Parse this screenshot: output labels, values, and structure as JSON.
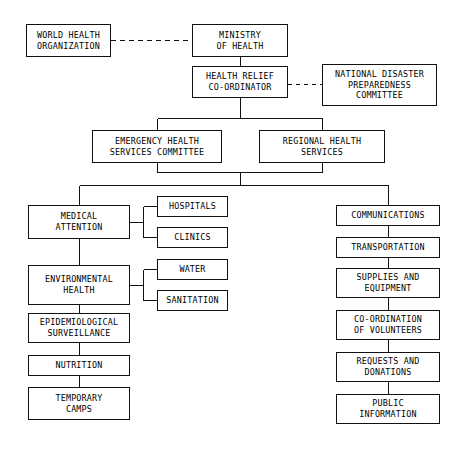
{
  "diagram": {
    "orientation": "top-down",
    "line_color": "#111111",
    "box_fill": "#ffffff",
    "text_color": "#000000",
    "nodes": [
      {
        "id": "who",
        "label": "WORLD HEALTH\nORGANIZATION",
        "x": 26,
        "y": 24,
        "w": 85,
        "h": 33
      },
      {
        "id": "ministry",
        "label": "MINISTRY\nOF HEALTH",
        "x": 192,
        "y": 24,
        "w": 96,
        "h": 33
      },
      {
        "id": "relief",
        "label": "HEALTH RELIEF\nCO-ORDINATOR",
        "x": 192,
        "y": 66,
        "w": 96,
        "h": 32
      },
      {
        "id": "ndpc",
        "label": "NATIONAL DISASTER\nPREPAREDNESS\nCOMMITTEE",
        "x": 322,
        "y": 64,
        "w": 115,
        "h": 42
      },
      {
        "id": "ehsc",
        "label": "EMERGENCY HEALTH\nSERVICES COMMITTEE",
        "x": 92,
        "y": 130,
        "w": 130,
        "h": 33
      },
      {
        "id": "rhs",
        "label": "REGIONAL HEALTH\nSERVICES",
        "x": 259,
        "y": 130,
        "w": 126,
        "h": 33
      },
      {
        "id": "medical",
        "label": "MEDICAL\nATTENTION",
        "x": 28,
        "y": 205,
        "w": 102,
        "h": 34
      },
      {
        "id": "hospitals",
        "label": "HOSPITALS",
        "x": 157,
        "y": 196,
        "w": 71,
        "h": 21
      },
      {
        "id": "clinics",
        "label": "CLINICS",
        "x": 157,
        "y": 227,
        "w": 71,
        "h": 21
      },
      {
        "id": "environmental",
        "label": "ENVIRONMENTAL\nHEALTH",
        "x": 28,
        "y": 265,
        "w": 102,
        "h": 40
      },
      {
        "id": "water",
        "label": "WATER",
        "x": 157,
        "y": 259,
        "w": 71,
        "h": 21
      },
      {
        "id": "sanitation",
        "label": "SANITATION",
        "x": 157,
        "y": 290,
        "w": 71,
        "h": 21
      },
      {
        "id": "epidemiological",
        "label": "EPIDEMIOLOGICAL\nSURVEILLANCE",
        "x": 28,
        "y": 313,
        "w": 102,
        "h": 30
      },
      {
        "id": "nutrition",
        "label": "NUTRITION",
        "x": 28,
        "y": 355,
        "w": 102,
        "h": 21
      },
      {
        "id": "temporary",
        "label": "TEMPORARY\nCAMPS",
        "x": 28,
        "y": 387,
        "w": 102,
        "h": 33
      },
      {
        "id": "communications",
        "label": "COMMUNICATIONS",
        "x": 336,
        "y": 205,
        "w": 104,
        "h": 21
      },
      {
        "id": "transportation",
        "label": "TRANSPORTATION",
        "x": 336,
        "y": 237,
        "w": 104,
        "h": 21
      },
      {
        "id": "supplies",
        "label": "SUPPLIES AND\nEQUIPMENT",
        "x": 336,
        "y": 268,
        "w": 104,
        "h": 30
      },
      {
        "id": "volunteers",
        "label": "CO-ORDINATION\nOF VOLUNTEERS",
        "x": 336,
        "y": 310,
        "w": 104,
        "h": 30
      },
      {
        "id": "requests",
        "label": "REQUESTS AND\nDONATIONS",
        "x": 336,
        "y": 352,
        "w": 104,
        "h": 30
      },
      {
        "id": "public",
        "label": "PUBLIC\nINFORMATION",
        "x": 336,
        "y": 394,
        "w": 104,
        "h": 30
      }
    ],
    "edges": [
      {
        "from": "who",
        "to": "ministry",
        "style": "dashed"
      },
      {
        "from": "relief",
        "to": "ndpc",
        "style": "dashed"
      },
      {
        "from": "ministry",
        "to": "relief",
        "style": "solid"
      },
      {
        "from": "relief",
        "to": "ehsc",
        "style": "solid"
      },
      {
        "from": "relief",
        "to": "rhs",
        "style": "solid"
      },
      {
        "from": "ehsc",
        "to": "services-bus",
        "style": "solid"
      },
      {
        "from": "rhs",
        "to": "services-bus",
        "style": "solid"
      },
      {
        "from": "services-bus",
        "to": "medical",
        "style": "solid"
      },
      {
        "from": "services-bus",
        "to": "communications",
        "style": "solid"
      },
      {
        "from": "medical",
        "to": "hospitals",
        "style": "solid"
      },
      {
        "from": "medical",
        "to": "clinics",
        "style": "solid"
      },
      {
        "from": "medical",
        "to": "environmental",
        "style": "solid"
      },
      {
        "from": "environmental",
        "to": "water",
        "style": "solid"
      },
      {
        "from": "environmental",
        "to": "sanitation",
        "style": "solid"
      },
      {
        "from": "environmental",
        "to": "epidemiological",
        "style": "solid"
      },
      {
        "from": "epidemiological",
        "to": "nutrition",
        "style": "solid"
      },
      {
        "from": "nutrition",
        "to": "temporary",
        "style": "solid"
      },
      {
        "from": "communications",
        "to": "transportation",
        "style": "solid"
      },
      {
        "from": "transportation",
        "to": "supplies",
        "style": "solid"
      },
      {
        "from": "supplies",
        "to": "volunteers",
        "style": "solid"
      },
      {
        "from": "volunteers",
        "to": "requests",
        "style": "solid"
      },
      {
        "from": "requests",
        "to": "public",
        "style": "solid"
      }
    ]
  }
}
